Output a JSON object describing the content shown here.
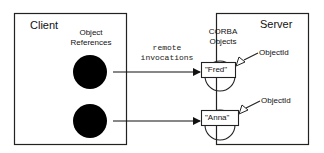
{
  "client": {
    "title": "Client",
    "references_label_1": "Object",
    "references_label_2": "References"
  },
  "server": {
    "title": "Server",
    "objects_label_1": "CORBA",
    "objects_label_2": "Objects",
    "objects": [
      {
        "name": "\"Fred\"",
        "id_label": "ObjectId"
      },
      {
        "name": "\"Anna\"",
        "id_label": "ObjectId"
      }
    ]
  },
  "connection": {
    "label_1": "remote",
    "label_2": "invocations"
  },
  "colors": {
    "stroke": "#222222",
    "fill_reference": "#000000",
    "background": "#ffffff"
  }
}
